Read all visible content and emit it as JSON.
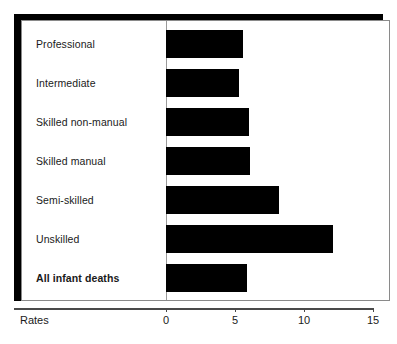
{
  "chart_data": {
    "type": "bar",
    "orientation": "horizontal",
    "title": "",
    "subtitle": "",
    "xlabel": "Rates",
    "ylabel": "",
    "categories": [
      "Professional",
      "Intermediate",
      "Skilled non-manual",
      "Skilled manual",
      "Semi-skilled",
      "Unskilled",
      "All infant deaths"
    ],
    "values": [
      5.6,
      5.3,
      6.0,
      6.1,
      8.2,
      12.1,
      5.9
    ],
    "emphasis_index": 6,
    "xlim": [
      0,
      15
    ],
    "xticks": [
      0,
      5,
      10,
      15
    ],
    "xtick_labels": [
      "0",
      "5",
      "10",
      "15"
    ],
    "grid": false,
    "legend": null,
    "bar_color": "#000000",
    "panel_background": "#ffffff",
    "frame_color": "#8a8a8a",
    "shadow_color": "#000000",
    "axis_color": "#4a4a4a"
  },
  "axis": {
    "name_label": "Rates"
  }
}
